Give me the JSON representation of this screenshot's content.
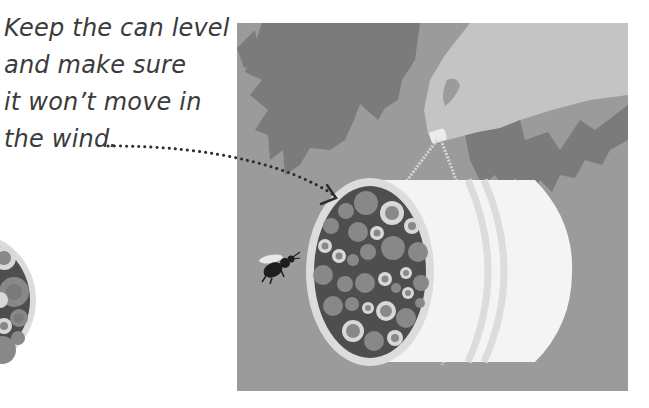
{
  "caption": {
    "lines": [
      "Keep the can level",
      "and make sure",
      "it won’t move in",
      "the wind."
    ]
  },
  "colors": {
    "text": "#3b3b3b",
    "panel_background": "#9b9b9b",
    "leaf": "#7b7b7b",
    "hand": "#c4c4c4",
    "can_body": "#f4f4f4",
    "can_rim": "#dcdcdc",
    "can_interior": "#4e4e4e",
    "tube": "#888888",
    "tube_ring": "#d8d8d8",
    "arrow_dots": "#2e2e2e",
    "bee": "#1e1e1e"
  },
  "illustration": {
    "subject": "bee hotel tin can hung from a tree branch",
    "elements": [
      "leaves",
      "hand",
      "string",
      "can",
      "bamboo-tubes",
      "bee",
      "dotted-arrow"
    ]
  }
}
